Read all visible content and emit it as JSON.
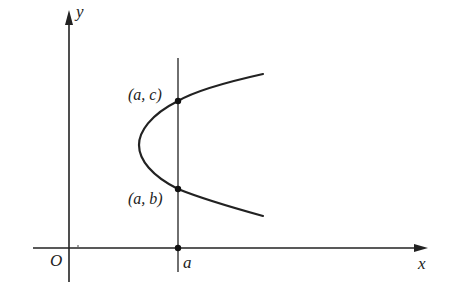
{
  "figure": {
    "type": "diagram",
    "axes": {
      "x_label": "x",
      "y_label": "y",
      "origin_label": "O"
    },
    "vertical_line": {
      "label": "a"
    },
    "points": [
      {
        "id": "upper",
        "label": "(a, c)"
      },
      {
        "id": "lower",
        "label": "(a, b)"
      },
      {
        "id": "axis",
        "label": "a"
      }
    ],
    "curve": "parabola opening to the right",
    "colors": {
      "stroke": "#222222",
      "background": "#ffffff"
    }
  }
}
